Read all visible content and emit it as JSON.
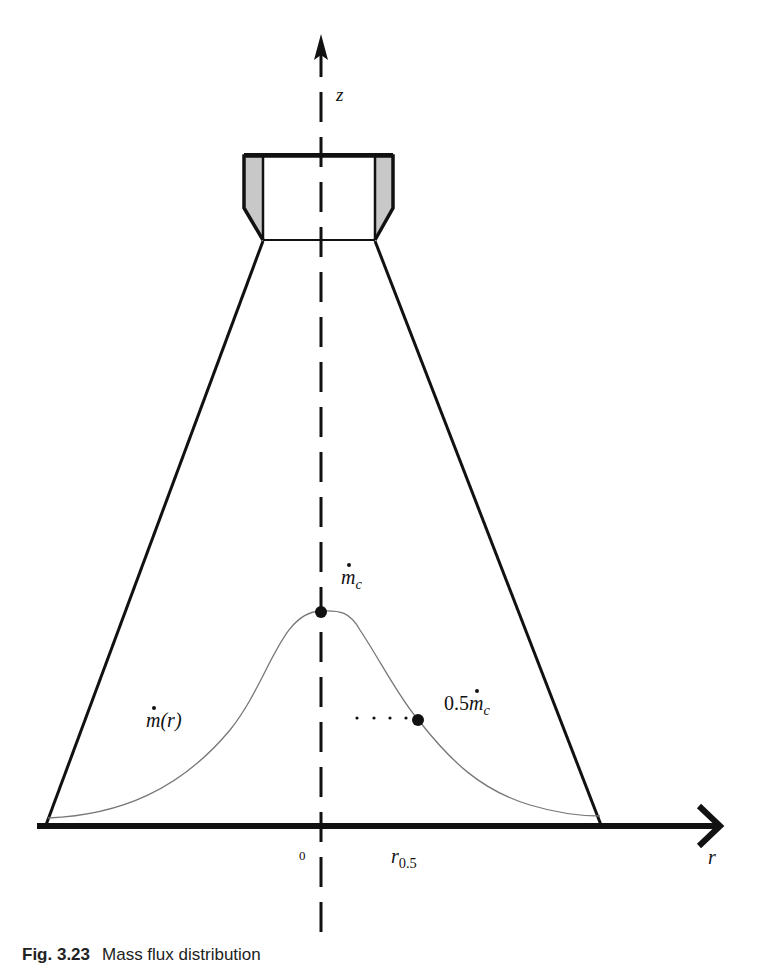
{
  "diagram": {
    "type": "spray-nozzle mass flux distribution",
    "axes": {
      "vertical": {
        "label": "z",
        "style": "dashed",
        "direction": "up"
      },
      "horizontal": {
        "label": "r",
        "style": "solid-thick",
        "direction": "right"
      }
    },
    "labels": {
      "z": "z",
      "r": "r",
      "origin": "0",
      "r_half_base": "r",
      "r_half_sub": "0.5",
      "m_center_base": "m",
      "m_center_sub": "c",
      "half_prefix": "0.5",
      "half_base": "m",
      "half_sub": "c",
      "profile_base": "m",
      "profile_arg": "(r)"
    },
    "annotations": [
      {
        "name": "centerline peak",
        "text": "ṁc",
        "point": "peak of profile on z axis"
      },
      {
        "name": "half-maximum point",
        "text": "0.5ṁc",
        "point": "at r = r0.5"
      },
      {
        "name": "profile",
        "text": "ṁ(r)"
      }
    ],
    "colors": {
      "line": "#111111",
      "profile_curve": "#777777",
      "nozzle_fill": "#c8c8c8",
      "background": "#ffffff"
    }
  },
  "caption": {
    "number": "Fig. 3.23",
    "text": "Mass flux distribution"
  }
}
